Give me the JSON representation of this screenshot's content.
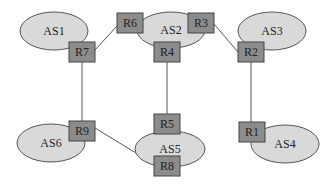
{
  "diagram": {
    "autonomous_systems": [
      {
        "id": "AS1",
        "label": "AS1"
      },
      {
        "id": "AS2",
        "label": "AS2"
      },
      {
        "id": "AS3",
        "label": "AS3"
      },
      {
        "id": "AS4",
        "label": "AS4"
      },
      {
        "id": "AS5",
        "label": "AS5"
      },
      {
        "id": "AS6",
        "label": "AS6"
      }
    ],
    "routers": [
      {
        "id": "R1",
        "label": "R1",
        "as": "AS4"
      },
      {
        "id": "R2",
        "label": "R2",
        "as": "AS3"
      },
      {
        "id": "R3",
        "label": "R3",
        "as": "AS2"
      },
      {
        "id": "R4",
        "label": "R4",
        "as": "AS2"
      },
      {
        "id": "R5",
        "label": "R5",
        "as": "AS5"
      },
      {
        "id": "R6",
        "label": "R6",
        "as": "AS2"
      },
      {
        "id": "R7",
        "label": "R7",
        "as": "AS1"
      },
      {
        "id": "R8",
        "label": "R8",
        "as": "AS5"
      },
      {
        "id": "R9",
        "label": "R9",
        "as": "AS6"
      }
    ],
    "links": [
      {
        "from": "R7",
        "to": "R6"
      },
      {
        "from": "R3",
        "to": "R2"
      },
      {
        "from": "R7",
        "to": "R9"
      },
      {
        "from": "R4",
        "to": "R5"
      },
      {
        "from": "R2",
        "to": "R1"
      },
      {
        "from": "R9",
        "to": "R8"
      }
    ],
    "colors": {
      "as_fill": "#d9d9d9",
      "router_fill": "#8c8c8c",
      "line": "#555555"
    }
  }
}
